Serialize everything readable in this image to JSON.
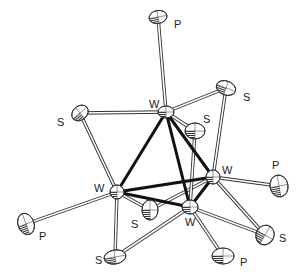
{
  "figure": {
    "type": "ORTEP molecular structure"
  },
  "atoms": [
    {
      "id": "P1",
      "element": "P",
      "label": "P",
      "x": 158,
      "y": 17,
      "rx": 9,
      "ry": 6.5,
      "rot": -10,
      "lx": 174,
      "ly": 28
    },
    {
      "id": "W1",
      "element": "W",
      "label": "W",
      "x": 166,
      "y": 112,
      "rx": 8,
      "ry": 6,
      "rot": 0,
      "lx": 149,
      "ly": 108
    },
    {
      "id": "S1",
      "element": "S",
      "label": "S",
      "x": 226,
      "y": 88,
      "rx": 10,
      "ry": 7,
      "rot": 20,
      "lx": 243,
      "ly": 101
    },
    {
      "id": "S2",
      "element": "S",
      "label": "S",
      "x": 80,
      "y": 113,
      "rx": 9,
      "ry": 7,
      "rot": -40,
      "lx": 57,
      "ly": 126
    },
    {
      "id": "S3",
      "element": "S",
      "label": "S",
      "x": 195,
      "y": 131,
      "rx": 10,
      "ry": 8,
      "rot": 0,
      "lx": 203,
      "ly": 123
    },
    {
      "id": "W2",
      "element": "W",
      "label": "W",
      "x": 213,
      "y": 177,
      "rx": 7,
      "ry": 7,
      "rot": 0,
      "lx": 222,
      "ly": 174
    },
    {
      "id": "P2",
      "element": "P",
      "label": "P",
      "x": 279,
      "y": 186,
      "rx": 9,
      "ry": 11,
      "rot": -10,
      "lx": 272,
      "ly": 169
    },
    {
      "id": "W3",
      "element": "W",
      "label": "W",
      "x": 117,
      "y": 192,
      "rx": 7,
      "ry": 7,
      "rot": 0,
      "lx": 94,
      "ly": 192
    },
    {
      "id": "W4",
      "element": "W",
      "label": "W",
      "x": 190,
      "y": 207,
      "rx": 8,
      "ry": 7,
      "rot": 0,
      "lx": 185,
      "ly": 226
    },
    {
      "id": "S4",
      "element": "S",
      "label": "S",
      "x": 150,
      "y": 210,
      "rx": 8,
      "ry": 10,
      "rot": 0,
      "lx": 131,
      "ly": 228
    },
    {
      "id": "S5",
      "element": "S",
      "label": "S",
      "x": 115,
      "y": 257,
      "rx": 11,
      "ry": 7,
      "rot": -10,
      "lx": 95,
      "ly": 264
    },
    {
      "id": "P3",
      "element": "P",
      "label": "P",
      "x": 26,
      "y": 224,
      "rx": 8,
      "ry": 11,
      "rot": -20,
      "lx": 39,
      "ly": 240
    },
    {
      "id": "S6",
      "element": "S",
      "label": "S",
      "x": 265,
      "y": 235,
      "rx": 9,
      "ry": 10,
      "rot": 30,
      "lx": 279,
      "ly": 242
    },
    {
      "id": "P4",
      "element": "P",
      "label": "P",
      "x": 223,
      "y": 256,
      "rx": 11,
      "ry": 8,
      "rot": 0,
      "lx": 240,
      "ly": 266
    }
  ],
  "metal_bonds": [
    [
      "W1",
      "W2"
    ],
    [
      "W1",
      "W3"
    ],
    [
      "W1",
      "W4"
    ],
    [
      "W2",
      "W3"
    ],
    [
      "W2",
      "W4"
    ],
    [
      "W3",
      "W4"
    ]
  ],
  "ligand_bonds": [
    [
      "W1",
      "P1"
    ],
    [
      "W1",
      "S1"
    ],
    [
      "W1",
      "S2"
    ],
    [
      "W1",
      "S3"
    ],
    [
      "S1",
      "W2"
    ],
    [
      "W2",
      "P2"
    ],
    [
      "W2",
      "S6"
    ],
    [
      "W2",
      "S4"
    ],
    [
      "S2",
      "W3"
    ],
    [
      "W3",
      "P3"
    ],
    [
      "W3",
      "S5"
    ],
    [
      "W3",
      "S4"
    ],
    [
      "S3",
      "W4"
    ],
    [
      "W4",
      "S5"
    ],
    [
      "W4",
      "S6"
    ],
    [
      "W4",
      "P4"
    ]
  ],
  "colors": {
    "background": "#ffffff",
    "metal_bond": "#111111",
    "ligand_bond": "#333333",
    "label": "#222222"
  }
}
